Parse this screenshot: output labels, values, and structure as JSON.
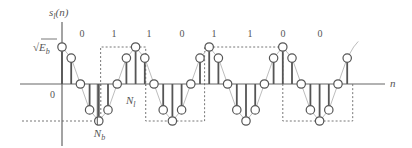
{
  "diagram": {
    "type": "stem-plot",
    "y_axis_label": "s_l(n)",
    "x_axis_label": "n",
    "origin_label": "0",
    "amplitude_label": "√E_b",
    "bits": [
      "0",
      "1",
      "1",
      "0",
      "1",
      "1",
      "0",
      "0"
    ],
    "annotations": {
      "period_label": "N_l",
      "bit_length_label": "N_b"
    },
    "samples_normalized": [
      1,
      0.7,
      0,
      -0.7,
      -1,
      -0.7,
      0,
      0.7,
      1,
      0.7,
      0,
      -0.7,
      -1,
      -0.7,
      0,
      0.7,
      1,
      0.7,
      0,
      -0.7,
      -1,
      -0.7,
      0,
      0.7,
      1,
      0.7,
      0,
      -0.7,
      -1,
      -0.7,
      0,
      0.7
    ],
    "colors": {
      "stem": "#555555",
      "envelope": "#bdbdbd",
      "axis": "#666666",
      "dashed": "#777777"
    }
  }
}
